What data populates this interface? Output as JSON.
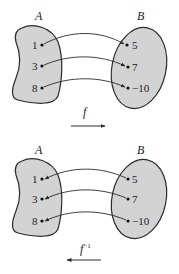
{
  "diagrams": [
    {
      "id": "forward",
      "set_a_label": "A",
      "set_b_label": "B",
      "function_label": "f",
      "function_sup": "",
      "arrow_direction": "right",
      "domain_values": [
        "1",
        "3",
        "8"
      ],
      "range_values": [
        "5",
        "7",
        "−10"
      ],
      "mapping": [
        [
          "1",
          "5"
        ],
        [
          "3",
          "7"
        ],
        [
          "8",
          "−10"
        ]
      ]
    },
    {
      "id": "inverse",
      "set_a_label": "A",
      "set_b_label": "B",
      "function_label": "f",
      "function_sup": "−1",
      "arrow_direction": "left",
      "domain_values": [
        "1",
        "3",
        "8"
      ],
      "range_values": [
        "5",
        "7",
        "−10"
      ],
      "mapping": [
        [
          "5",
          "1"
        ],
        [
          "7",
          "3"
        ],
        [
          "−10",
          "8"
        ]
      ]
    }
  ],
  "colors": {
    "fill": "#d3d3d3",
    "stroke": "#2a2a2a"
  }
}
